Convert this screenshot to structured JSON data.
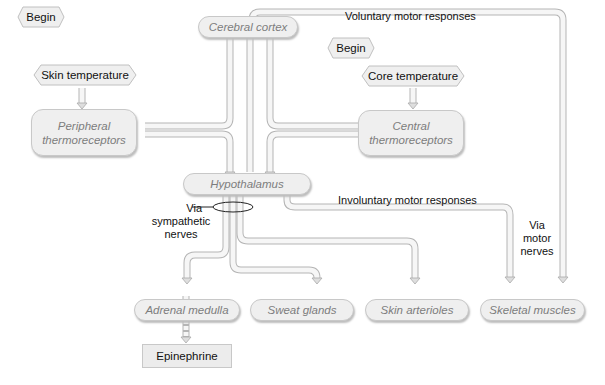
{
  "start_markers": [
    {
      "label": "Begin"
    },
    {
      "label": "Begin"
    }
  ],
  "inputs": {
    "skin_temperature": "Skin temperature",
    "core_temperature": "Core temperature"
  },
  "nodes": {
    "peripheral": {
      "line1": "Peripheral",
      "line2": "thermoreceptors"
    },
    "central": {
      "line1": "Central",
      "line2": "thermoreceptors"
    },
    "cerebral_cortex": "Cerebral cortex",
    "hypothalamus": "Hypothalamus",
    "adrenal_medulla": "Adrenal medulla",
    "sweat_glands": "Sweat glands",
    "skin_arterioles": "Skin arterioles",
    "skeletal_muscles": "Skeletal muscles",
    "epinephrine": "Epinephrine"
  },
  "annotations": {
    "voluntary": "Voluntary motor responses",
    "involuntary": "Involuntary motor responses",
    "via_sympathetic": {
      "line1": "Via",
      "line2": "sympathetic",
      "line3": "nerves"
    },
    "via_motor": {
      "line1": "Via",
      "line2": "motor",
      "line3": "nerves"
    }
  },
  "colors": {
    "pipe_fill": "#f4f4f4",
    "pipe_edge": "#b9b9b9",
    "node_fill": "#efefef",
    "node_text": "#7d7d7d"
  }
}
